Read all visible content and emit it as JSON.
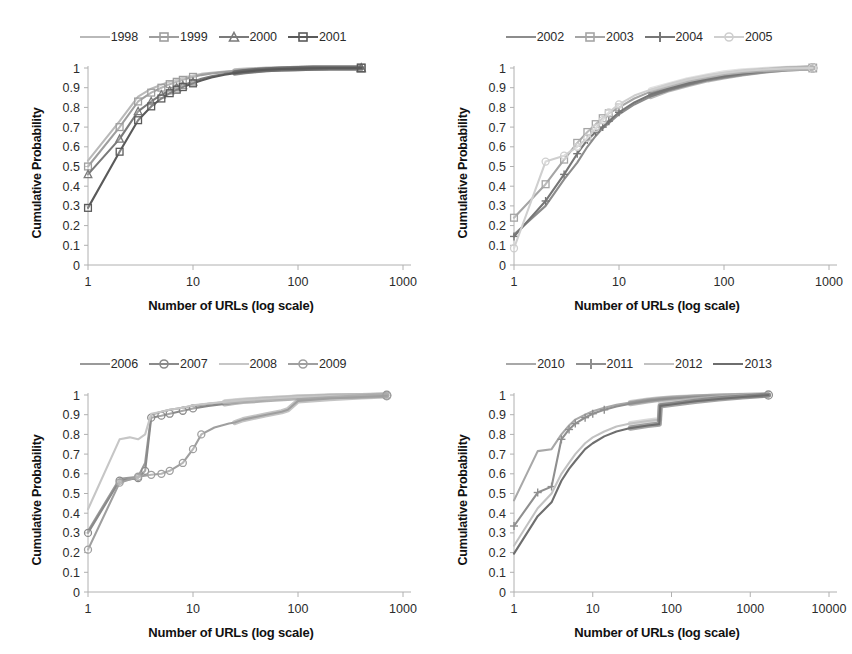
{
  "figure": {
    "background": "#ffffff",
    "panel_count": 4,
    "shared": {
      "xlabel": "Number of URLs (log scale)",
      "ylabel": "Cumulative Probability",
      "ytick_labels": [
        "1",
        "0.9",
        "0.8",
        "0.7",
        "0.6",
        "0.5",
        "0.4",
        "0.3",
        "0.2",
        "0.1",
        "0"
      ],
      "ylim": [
        0,
        1
      ],
      "grid": false,
      "legend_position": "top-center"
    }
  },
  "chart_data": [
    {
      "type": "line",
      "panel": "top-left",
      "title": "",
      "xlabel": "Number of URLs (log scale)",
      "ylabel": "Cumulative Probability",
      "xscale": "log",
      "xlim": [
        1,
        1000
      ],
      "xtick_labels": [
        "1",
        "10",
        "100",
        "1000"
      ],
      "ylim": [
        0,
        1
      ],
      "ytick_labels": [
        "1",
        "0.9",
        "0.8",
        "0.7",
        "0.6",
        "0.5",
        "0.4",
        "0.3",
        "0.2",
        "0.1",
        "0"
      ],
      "grid": false,
      "legend": [
        "1998",
        "1999",
        "2000",
        "2001"
      ],
      "series": [
        {
          "name": "1998",
          "color": "#b9b9b9",
          "marker": "none",
          "x": [
            1,
            2,
            3,
            4,
            5,
            6,
            7,
            8,
            10,
            12,
            15,
            20,
            25,
            30,
            40,
            50,
            70,
            100,
            140,
            200,
            400
          ],
          "values": [
            0.53,
            0.73,
            0.855,
            0.895,
            0.915,
            0.93,
            0.94,
            0.95,
            0.962,
            0.97,
            0.976,
            0.982,
            0.986,
            0.989,
            0.992,
            0.994,
            0.996,
            0.998,
            0.999,
            1.0,
            1.0
          ]
        },
        {
          "name": "1999",
          "color": "#9e9e9e",
          "marker": "square-open",
          "x": [
            1,
            2,
            3,
            4,
            5,
            6,
            7,
            8,
            10,
            12,
            15,
            20,
            25,
            30,
            40,
            50,
            70,
            100,
            140,
            200,
            400
          ],
          "values": [
            0.5,
            0.7,
            0.83,
            0.875,
            0.9,
            0.918,
            0.93,
            0.94,
            0.955,
            0.964,
            0.972,
            0.979,
            0.984,
            0.987,
            0.991,
            0.993,
            0.996,
            0.998,
            0.999,
            1.0,
            1.0
          ]
        },
        {
          "name": "2000",
          "color": "#7a7a7a",
          "marker": "triangle-open",
          "x": [
            1,
            2,
            3,
            4,
            5,
            6,
            7,
            8,
            10,
            12,
            15,
            20,
            25,
            30,
            40,
            50,
            70,
            100,
            140,
            200,
            400
          ],
          "values": [
            0.46,
            0.64,
            0.78,
            0.83,
            0.865,
            0.885,
            0.9,
            0.912,
            0.93,
            0.945,
            0.958,
            0.97,
            0.977,
            0.982,
            0.988,
            0.991,
            0.995,
            0.997,
            0.999,
            1.0,
            1.0
          ]
        },
        {
          "name": "2001",
          "color": "#5a5a5a",
          "marker": "square-open",
          "x": [
            1,
            2,
            3,
            4,
            5,
            6,
            7,
            8,
            10,
            12,
            15,
            20,
            25,
            30,
            40,
            50,
            70,
            100,
            140,
            200,
            400
          ],
          "values": [
            0.29,
            0.575,
            0.735,
            0.805,
            0.845,
            0.872,
            0.89,
            0.903,
            0.922,
            0.937,
            0.952,
            0.966,
            0.974,
            0.98,
            0.987,
            0.991,
            0.995,
            0.997,
            0.999,
            1.0,
            1.0
          ]
        }
      ]
    },
    {
      "type": "line",
      "panel": "top-right",
      "title": "",
      "xlabel": "Number of URLs (log scale)",
      "ylabel": "Cumulative Probability",
      "xscale": "log",
      "xlim": [
        1,
        1000
      ],
      "xtick_labels": [
        "1",
        "10",
        "100",
        "1000"
      ],
      "ylim": [
        0,
        1
      ],
      "ytick_labels": [
        "1",
        "0.9",
        "0.8",
        "0.7",
        "0.6",
        "0.5",
        "0.4",
        "0.3",
        "0.2",
        "0.1",
        "0"
      ],
      "grid": false,
      "legend": [
        "2002",
        "2003",
        "2004",
        "2005"
      ],
      "series": [
        {
          "name": "2002",
          "color": "#8c8c8c",
          "marker": "none",
          "x": [
            1,
            2,
            3,
            4,
            5,
            6,
            7,
            8,
            10,
            14,
            20,
            30,
            45,
            70,
            100,
            150,
            250,
            400,
            700
          ],
          "values": [
            0.155,
            0.3,
            0.435,
            0.52,
            0.6,
            0.655,
            0.695,
            0.72,
            0.765,
            0.815,
            0.855,
            0.89,
            0.915,
            0.94,
            0.955,
            0.97,
            0.985,
            0.995,
            1.0
          ]
        },
        {
          "name": "2003",
          "color": "#a5a5a5",
          "marker": "square-open",
          "x": [
            1,
            2,
            3,
            4,
            5,
            6,
            7,
            8,
            10,
            14,
            20,
            30,
            45,
            70,
            100,
            150,
            250,
            400,
            700
          ],
          "values": [
            0.24,
            0.41,
            0.535,
            0.62,
            0.675,
            0.715,
            0.745,
            0.77,
            0.8,
            0.845,
            0.88,
            0.91,
            0.935,
            0.955,
            0.968,
            0.98,
            0.99,
            0.997,
            1.0
          ]
        },
        {
          "name": "2004",
          "color": "#767676",
          "marker": "plus",
          "x": [
            1,
            2,
            3,
            4,
            5,
            6,
            7,
            8,
            10,
            14,
            20,
            30,
            45,
            70,
            100,
            150,
            250,
            400,
            700
          ],
          "values": [
            0.145,
            0.325,
            0.46,
            0.565,
            0.635,
            0.675,
            0.7,
            0.73,
            0.775,
            0.825,
            0.865,
            0.895,
            0.92,
            0.945,
            0.958,
            0.972,
            0.986,
            0.996,
            1.0
          ]
        },
        {
          "name": "2005",
          "color": "#cfcfcf",
          "marker": "circle-open",
          "x": [
            1,
            2,
            3,
            4,
            5,
            6,
            7,
            8,
            10,
            14,
            20,
            30,
            45,
            70,
            100,
            150,
            250,
            400,
            700
          ],
          "values": [
            0.085,
            0.525,
            0.555,
            0.6,
            0.645,
            0.695,
            0.735,
            0.775,
            0.815,
            0.86,
            0.89,
            0.915,
            0.94,
            0.96,
            0.975,
            0.985,
            0.993,
            0.998,
            1.0
          ]
        }
      ]
    },
    {
      "type": "line",
      "panel": "bottom-left",
      "title": "",
      "xlabel": "Number of URLs (log scale)",
      "ylabel": "Cumulative Probability",
      "xscale": "log",
      "xlim": [
        1,
        1000
      ],
      "xtick_labels": [
        "1",
        "10",
        "100",
        "1000"
      ],
      "ylim": [
        0,
        1
      ],
      "ytick_labels": [
        "1",
        "0.9",
        "0.8",
        "0.7",
        "0.6",
        "0.5",
        "0.4",
        "0.3",
        "0.2",
        "0.1",
        "0"
      ],
      "grid": false,
      "legend": [
        "2006",
        "2007",
        "2008",
        "2009"
      ],
      "series": [
        {
          "name": "2006",
          "color": "#9a9a9a",
          "marker": "none",
          "x": [
            1,
            2,
            3,
            3.5,
            4,
            5,
            6,
            8,
            10,
            14,
            20,
            25,
            30,
            50,
            80,
            100,
            200,
            400,
            700
          ],
          "values": [
            0.31,
            0.575,
            0.585,
            0.655,
            0.9,
            0.915,
            0.925,
            0.935,
            0.945,
            0.955,
            0.963,
            0.968,
            0.972,
            0.98,
            0.986,
            0.989,
            0.994,
            0.997,
            0.999
          ]
        },
        {
          "name": "2007",
          "color": "#8a8a8a",
          "marker": "circle-open",
          "x": [
            1,
            2,
            3,
            3.5,
            4,
            5,
            6,
            8,
            10,
            14,
            20,
            25,
            30,
            50,
            80,
            100,
            200,
            400,
            700
          ],
          "values": [
            0.3,
            0.565,
            0.578,
            0.615,
            0.885,
            0.895,
            0.905,
            0.92,
            0.932,
            0.945,
            0.955,
            0.962,
            0.967,
            0.976,
            0.983,
            0.986,
            0.993,
            0.996,
            0.999
          ]
        },
        {
          "name": "2008",
          "color": "#c6c6c6",
          "marker": "none",
          "x": [
            1,
            2,
            2.5,
            3,
            3.5,
            4,
            5,
            6,
            8,
            10,
            14,
            20,
            25,
            30,
            50,
            80,
            100,
            200,
            400,
            700
          ],
          "values": [
            0.42,
            0.775,
            0.785,
            0.775,
            0.8,
            0.905,
            0.915,
            0.925,
            0.935,
            0.948,
            0.957,
            0.965,
            0.97,
            0.974,
            0.981,
            0.987,
            0.99,
            0.995,
            0.997,
            0.999
          ]
        },
        {
          "name": "2009",
          "color": "#9f9f9f",
          "marker": "circle-open",
          "x": [
            1,
            2,
            3,
            4,
            5,
            6,
            8,
            10,
            12,
            16,
            22,
            25,
            30,
            50,
            70,
            80,
            100,
            200,
            400,
            700
          ],
          "values": [
            0.215,
            0.555,
            0.585,
            0.595,
            0.6,
            0.615,
            0.655,
            0.725,
            0.8,
            0.835,
            0.855,
            0.86,
            0.875,
            0.9,
            0.915,
            0.925,
            0.97,
            0.982,
            0.99,
            0.996
          ]
        }
      ]
    },
    {
      "type": "line",
      "panel": "bottom-right",
      "title": "",
      "xlabel": "Number of URLs (log scale)",
      "ylabel": "Cumulative Probability",
      "xscale": "log",
      "xlim": [
        1,
        10000
      ],
      "xtick_labels": [
        "1",
        "10",
        "100",
        "1000",
        "10000"
      ],
      "ylim": [
        0,
        1
      ],
      "ytick_labels": [
        "1",
        "0.9",
        "0.8",
        "0.7",
        "0.6",
        "0.5",
        "0.4",
        "0.3",
        "0.2",
        "0.1",
        "0"
      ],
      "grid": false,
      "legend": [
        "2010",
        "2011",
        "2012",
        "2013"
      ],
      "series": [
        {
          "name": "2010",
          "color": "#a8a8a8",
          "marker": "none",
          "x": [
            1,
            2,
            3,
            4,
            5,
            6,
            8,
            10,
            14,
            20,
            30,
            50,
            70,
            80,
            100,
            200,
            400,
            800,
            1700
          ],
          "values": [
            0.465,
            0.715,
            0.725,
            0.8,
            0.845,
            0.875,
            0.9,
            0.918,
            0.935,
            0.95,
            0.962,
            0.974,
            0.98,
            0.982,
            0.985,
            0.991,
            0.995,
            0.998,
            1.0
          ]
        },
        {
          "name": "2011",
          "color": "#8f8f8f",
          "marker": "plus",
          "x": [
            1,
            2,
            3,
            4,
            5,
            6,
            8,
            10,
            14,
            20,
            30,
            50,
            70,
            80,
            100,
            200,
            400,
            800,
            1700
          ],
          "values": [
            0.335,
            0.505,
            0.535,
            0.775,
            0.825,
            0.855,
            0.885,
            0.905,
            0.925,
            0.942,
            0.956,
            0.97,
            0.977,
            0.979,
            0.982,
            0.989,
            0.994,
            0.997,
            1.0
          ]
        },
        {
          "name": "2012",
          "color": "#c2c2c2",
          "marker": "none",
          "x": [
            1,
            2,
            3,
            4,
            5,
            6,
            8,
            10,
            14,
            20,
            30,
            50,
            70,
            72,
            100,
            200,
            400,
            800,
            1700
          ],
          "values": [
            0.235,
            0.425,
            0.5,
            0.6,
            0.655,
            0.7,
            0.755,
            0.785,
            0.815,
            0.84,
            0.855,
            0.868,
            0.875,
            0.955,
            0.962,
            0.975,
            0.985,
            0.993,
            1.0
          ]
        },
        {
          "name": "2013",
          "color": "#6e6e6e",
          "marker": "none",
          "x": [
            1,
            2,
            3,
            4,
            5,
            6,
            8,
            10,
            14,
            20,
            30,
            50,
            70,
            72,
            100,
            200,
            400,
            800,
            1700
          ],
          "values": [
            0.195,
            0.385,
            0.455,
            0.565,
            0.625,
            0.665,
            0.725,
            0.755,
            0.79,
            0.815,
            0.832,
            0.845,
            0.852,
            0.945,
            0.952,
            0.968,
            0.98,
            0.99,
            1.0
          ]
        }
      ]
    }
  ]
}
